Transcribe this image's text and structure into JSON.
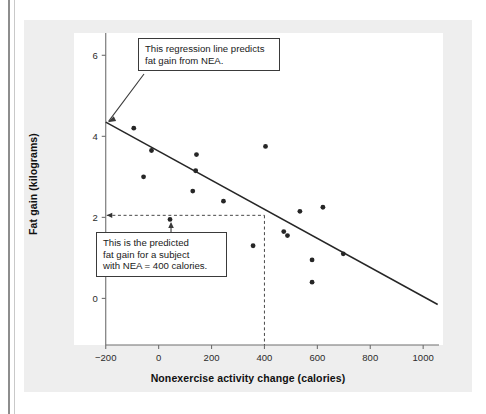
{
  "figure": {
    "background_color": "#eeeeee",
    "plot_background_color": "#ffffff",
    "axis_color": "#6f6f6f",
    "line_color": "#262626",
    "point_color": "#262626"
  },
  "annotations": {
    "callout_regression": "This regression line predicts\nfat gain from NEA.",
    "callout_prediction": "This is the predicted\nfat gain for a subject\nwith NEA = 400 calories."
  },
  "chart_data": {
    "type": "scatter",
    "title": "",
    "xlabel": "Nonexercise activity change (calories)",
    "ylabel": "Fat gain (kilograms)",
    "xlim": [
      -320,
      1075
    ],
    "ylim": [
      -1.15,
      6.55
    ],
    "xticks": [
      -200,
      0,
      200,
      400,
      600,
      800,
      1000
    ],
    "xtick_labels": [
      "−200",
      "0",
      "200",
      "400",
      "600",
      "800",
      "1000"
    ],
    "yticks": [
      0,
      2,
      4,
      6
    ],
    "ytick_labels": [
      "0",
      "2",
      "4",
      "6"
    ],
    "grid": false,
    "legend": null,
    "points": [
      {
        "x": -94,
        "y": 4.2
      },
      {
        "x": -27,
        "y": 3.65
      },
      {
        "x": -57,
        "y": 3.0
      },
      {
        "x": 143,
        "y": 3.55
      },
      {
        "x": 140,
        "y": 3.15
      },
      {
        "x": 129,
        "y": 2.65
      },
      {
        "x": 245,
        "y": 2.4
      },
      {
        "x": 43,
        "y": 1.95
      },
      {
        "x": 404,
        "y": 3.75
      },
      {
        "x": 357,
        "y": 1.3
      },
      {
        "x": 534,
        "y": 2.15
      },
      {
        "x": 621,
        "y": 2.25
      },
      {
        "x": 473,
        "y": 1.65
      },
      {
        "x": 487,
        "y": 1.55
      },
      {
        "x": 580,
        "y": 0.95
      },
      {
        "x": 580,
        "y": 0.4
      },
      {
        "x": 698,
        "y": 1.1
      }
    ],
    "regression_line": {
      "x_start": -200,
      "y_start": 4.35,
      "x_end": 1055,
      "y_end": -0.15,
      "description": "least-squares regression line of fat gain on NEA"
    },
    "prediction_guides": {
      "x_value": 400,
      "y_value": 2.05,
      "style": "dashed"
    }
  }
}
